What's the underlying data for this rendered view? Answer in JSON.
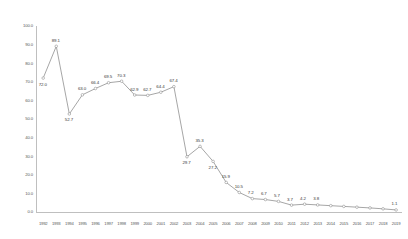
{
  "chart_data": {
    "type": "line",
    "title": "",
    "subtitle": "",
    "xlabel": "",
    "ylabel": "",
    "grid": false,
    "legend": "none",
    "ylim": [
      0.0,
      100.0
    ],
    "ytick_labels": [
      "0.0",
      "10.0",
      "20.0",
      "30.0",
      "40.0",
      "50.0",
      "60.0",
      "70.0",
      "80.0",
      "90.0",
      "100.0"
    ],
    "ytick_values": [
      0,
      10,
      20,
      30,
      40,
      50,
      60,
      70,
      80,
      90,
      100
    ],
    "categories": [
      "1992",
      "1993",
      "1994",
      "1995",
      "1996",
      "1997",
      "1998",
      "1999",
      "2000",
      "2001",
      "2002",
      "2003",
      "2004",
      "2005",
      "2006",
      "2007",
      "2008",
      "2009",
      "2010",
      "2011",
      "2012",
      "2013",
      "2014",
      "2015",
      "2016",
      "2017",
      "2018",
      "2019"
    ],
    "values": [
      72.0,
      89.1,
      52.7,
      63.0,
      66.4,
      69.5,
      70.3,
      62.9,
      62.7,
      64.4,
      67.4,
      29.7,
      35.3,
      27.2,
      15.9,
      10.5,
      7.2,
      6.7,
      5.7,
      3.7,
      4.2,
      3.8,
      3.4,
      3.0,
      2.6,
      2.2,
      1.7,
      1.1
    ],
    "point_labels": [
      "72.0",
      "89.1",
      "52.7",
      "63.0",
      "66.4",
      "69.5",
      "70.3",
      "62.9",
      "62.7",
      "64.4",
      "67.4",
      "29.7",
      "35.3",
      "27.2",
      "15.9",
      "10.5",
      "7.2",
      "6.7",
      "5.7",
      "3.7",
      "4.2",
      "3.8",
      "",
      "",
      "",
      "",
      "",
      "1.1"
    ],
    "series": [
      {
        "name": "series-1",
        "color": "#808080",
        "values": [
          72.0,
          89.1,
          52.7,
          63.0,
          66.4,
          69.5,
          70.3,
          62.9,
          62.7,
          64.4,
          67.4,
          29.7,
          35.3,
          27.2,
          15.9,
          10.5,
          7.2,
          6.7,
          5.7,
          3.7,
          4.2,
          3.8,
          3.4,
          3.0,
          2.6,
          2.2,
          1.7,
          1.1
        ]
      }
    ],
    "colors": {
      "line": "#808080",
      "marker_fill": "#ffffff",
      "marker_stroke": "#7f7f7f",
      "axis": "#bfbfbf",
      "text": "#595959",
      "background": "#ffffff"
    }
  }
}
